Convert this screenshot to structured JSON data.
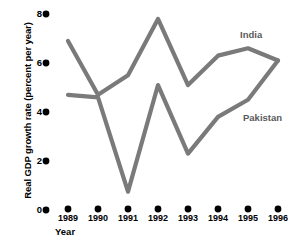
{
  "chart_data": {
    "type": "line",
    "title": "",
    "subtitle": "",
    "xlabel": "Year",
    "ylabel": "Real GDP growth rate (percent per year)",
    "categories": [
      "1989",
      "1990",
      "1991",
      "1992",
      "1993",
      "1994",
      "1995",
      "1996"
    ],
    "x": [
      1989,
      1990,
      1991,
      1992,
      1993,
      1994,
      1995,
      1996
    ],
    "xlim": [
      1989,
      1996
    ],
    "ylim": [
      0,
      8
    ],
    "yticks": [
      0,
      2,
      4,
      6,
      8
    ],
    "ytick_labels": [
      "0",
      "2",
      "4",
      "6",
      "8"
    ],
    "grid": false,
    "legend_position": "inline-annotation",
    "series": [
      {
        "name": "India",
        "color": "#7a7a7a",
        "values": [
          6.9,
          4.7,
          5.5,
          7.8,
          5.1,
          6.3,
          6.6,
          6.1
        ]
      },
      {
        "name": "Pakistan",
        "color": "#7a7a7a",
        "values": [
          4.7,
          4.6,
          0.75,
          5.1,
          2.3,
          3.8,
          4.5,
          6.1
        ]
      }
    ],
    "annotations": [
      {
        "text": "India",
        "x": 1994.6,
        "y": 7.15
      },
      {
        "text": "Pakistan",
        "x": 1994.7,
        "y": 3.75
      }
    ],
    "colors": {
      "line": "#7a7a7a",
      "text": "#000000",
      "annotation_text": "#5a5a5a",
      "marker": "#000000",
      "background": "#ffffff"
    },
    "axis_marker_style": "dot"
  }
}
